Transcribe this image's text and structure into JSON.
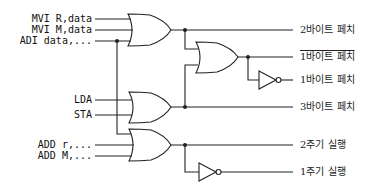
{
  "diagram": {
    "type": "logic-circuit",
    "inputs": [
      {
        "id": "mvi_r",
        "label": "MVI R,data",
        "y": 19
      },
      {
        "id": "mvi_m",
        "label": "MVI M,data",
        "y": 30
      },
      {
        "id": "adi",
        "label": "ADI data,...",
        "y": 41
      },
      {
        "id": "lda",
        "label": "LDA",
        "y": 100
      },
      {
        "id": "sta",
        "label": "STA",
        "y": 115
      },
      {
        "id": "add_r",
        "label": "ADD r,...",
        "y": 145
      },
      {
        "id": "add_m",
        "label": "ADD M,...",
        "y": 156
      }
    ],
    "outputs": [
      {
        "id": "fetch2",
        "label": "2바이트 페치",
        "y": 30,
        "complement": false
      },
      {
        "id": "fetch1_bar",
        "label": "1바이트 페치",
        "y": 57,
        "complement": true
      },
      {
        "id": "fetch1",
        "label": "1바이트 페치",
        "y": 80,
        "complement": false
      },
      {
        "id": "fetch3",
        "label": "3바이트 페치",
        "y": 107,
        "complement": false
      },
      {
        "id": "exec2",
        "label": "2주기 실행",
        "y": 145,
        "complement": false
      },
      {
        "id": "exec1",
        "label": "1주기 실행",
        "y": 172,
        "complement": false
      }
    ],
    "gates": [
      {
        "id": "or1",
        "type": "OR",
        "inputs": [
          "MVI R,data",
          "MVI M,data",
          "ADI data,..."
        ],
        "output": "2바이트 페치"
      },
      {
        "id": "or2",
        "type": "OR",
        "inputs": [
          "or1",
          "or3"
        ],
        "output": "1바이트 페치 (complement)"
      },
      {
        "id": "not1",
        "type": "NOT",
        "inputs": [
          "or2"
        ],
        "output": "1바이트 페치"
      },
      {
        "id": "or3",
        "type": "OR",
        "inputs": [
          "LDA",
          "STA"
        ],
        "output": "3바이트 페치"
      },
      {
        "id": "or4",
        "type": "OR",
        "inputs": [
          "ADI data,...",
          "ADD r,...",
          "ADD M,..."
        ],
        "output": "2주기 실행"
      },
      {
        "id": "not2",
        "type": "NOT",
        "inputs": [
          "or4"
        ],
        "output": "1주기 실행"
      }
    ],
    "line_color": "#222222"
  }
}
